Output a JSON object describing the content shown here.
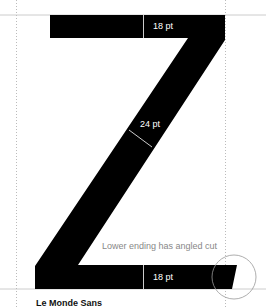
{
  "diagram": {
    "letter": "Z",
    "annotations": {
      "top_bar": "18 pt",
      "diagonal": "24 pt",
      "bottom_bar": "18 pt",
      "note": "Lower ending has angled cut"
    },
    "caption": "Le Monde Sans",
    "colors": {
      "glyph": "#000000",
      "guides": "#bbbbbb",
      "label_on_black": "#ffffff",
      "label_on_white": "#888888"
    }
  }
}
